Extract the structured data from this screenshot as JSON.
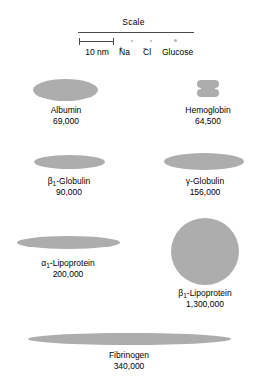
{
  "figure": {
    "title": "Scale",
    "background_color": "#ffffff",
    "shape_color": "#adadad",
    "line_color": "#4a4a4a",
    "text_color": "#000000"
  },
  "scale": {
    "title": "Scale",
    "bar_label": "10 nm",
    "molecules": [
      {
        "id": "sodium",
        "label": "Na",
        "charge": "+",
        "icon": "tiny-dot"
      },
      {
        "id": "chloride",
        "label": "Cl",
        "charge": "−",
        "icon": "tiny-dot"
      },
      {
        "id": "glucose",
        "label": "Glucose",
        "charge": "",
        "icon": "tiny-dot"
      }
    ]
  },
  "proteins": [
    {
      "id": "albumin",
      "name": "Albumin",
      "name_prefix": "",
      "name_subscript": "",
      "mass": "69,000",
      "shape": "ellipse"
    },
    {
      "id": "hemoglobin",
      "name": "Hemoglobin",
      "name_prefix": "",
      "name_subscript": "",
      "mass": "64,500",
      "shape": "notched-block"
    },
    {
      "id": "beta1-globulin",
      "name": "-Globulin",
      "name_prefix": "β",
      "name_subscript": "1",
      "mass": "90,000",
      "shape": "ellipse"
    },
    {
      "id": "gamma-globulin",
      "name": "-Globulin",
      "name_prefix": "γ",
      "name_subscript": "",
      "mass": "156,000",
      "shape": "ellipse"
    },
    {
      "id": "alpha1-lipoprotein",
      "name": "-Lipoprotein",
      "name_prefix": "α",
      "name_subscript": "1",
      "mass": "200,000",
      "shape": "ellipse"
    },
    {
      "id": "beta1-lipoprotein",
      "name": "-Lipoprotein",
      "name_prefix": "β",
      "name_subscript": "1",
      "mass": "1,300,000",
      "shape": "circle"
    },
    {
      "id": "fibrinogen",
      "name": "Fibrinogen",
      "name_prefix": "",
      "name_subscript": "",
      "mass": "340,000",
      "shape": "ellipse"
    }
  ]
}
